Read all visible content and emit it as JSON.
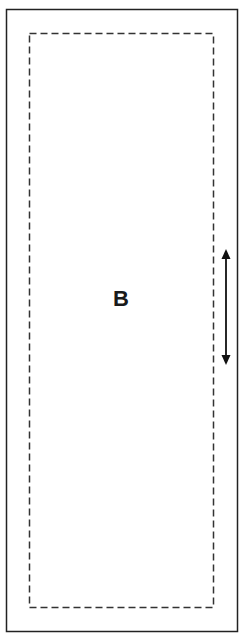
{
  "diagram": {
    "region_label": "B",
    "outer_border": {
      "x": 6,
      "y": 9,
      "width": 231,
      "height": 622,
      "style": "solid"
    },
    "inner_border": {
      "x": 29,
      "y": 33,
      "width": 184,
      "height": 574,
      "style": "dashed"
    },
    "arrow": {
      "type": "double-headed",
      "orientation": "vertical",
      "x": 226,
      "y1": 250,
      "y2": 364
    },
    "colors": {
      "stroke": "#222222",
      "background": "#ffffff"
    }
  }
}
